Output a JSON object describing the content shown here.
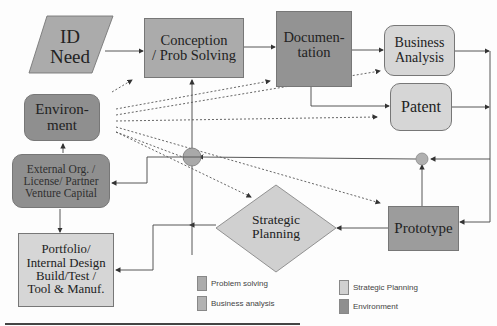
{
  "colors": {
    "problem_solving": "#ababab",
    "business_analysis": "#d6d6d6",
    "strategic_planning": "#d0d0d0",
    "environment": "#8f8f8f",
    "lines": "#333333"
  },
  "nodes": {
    "id_need": "ID\nNeed",
    "conception": "Conception\n/ Prob Solving",
    "documentation": "Documen-\ntation",
    "business_analysis": "Business\nAnalysis",
    "patent": "Patent",
    "environment": "Environ-\nment",
    "external_org": "External Org. /\nLicense/ Partner\nVenture Capital",
    "strategic_planning": "Strategic\nPlanning",
    "prototype": "Prototype",
    "portfolio": "Portfolio/\nInternal Design\nBuild/Test /\nTool & Manuf."
  },
  "legend": [
    {
      "label": "Problem solving",
      "color": "#ababab"
    },
    {
      "label": "Business analysis",
      "color": "#b2b2b2"
    },
    {
      "label": "Strategic Planning",
      "color": "#d0d0d0"
    },
    {
      "label": "Environment",
      "color": "#8f8f8f"
    }
  ]
}
